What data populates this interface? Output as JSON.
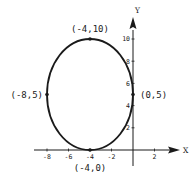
{
  "chart_data": {
    "type": "line",
    "title": "",
    "xlabel": "X",
    "ylabel": "Y",
    "xlim": [
      -9.5,
      3.5
    ],
    "ylim": [
      -1.5,
      12
    ],
    "grid": false,
    "curve": {
      "name": "ellipse",
      "center": [
        -4,
        5
      ],
      "semi_axis_x": 4,
      "semi_axis_y": 5,
      "equation": "(x+4)^2/16 + (y-5)^2/25 = 1"
    },
    "x_ticks": [
      {
        "value": -8,
        "label": "-8"
      },
      {
        "value": -6,
        "label": "-6"
      },
      {
        "value": -4,
        "label": "-4"
      },
      {
        "value": -2,
        "label": "-2"
      },
      {
        "value": 2,
        "label": "2"
      }
    ],
    "y_ticks": [
      {
        "value": 2,
        "label": "2"
      },
      {
        "value": 4,
        "label": "4"
      },
      {
        "value": 6,
        "label": "6"
      },
      {
        "value": 8,
        "label": "8"
      },
      {
        "value": 10,
        "label": "10"
      }
    ],
    "points": [
      {
        "x": -4,
        "y": 10,
        "label": "(-4,10)",
        "label_pos": "above"
      },
      {
        "x": -8,
        "y": 5,
        "label": "(-8,5)",
        "label_pos": "left"
      },
      {
        "x": 0,
        "y": 5,
        "label": "(0,5)",
        "label_pos": "right"
      },
      {
        "x": -4,
        "y": 0,
        "label": "(-4,0)",
        "label_pos": "below"
      }
    ]
  }
}
